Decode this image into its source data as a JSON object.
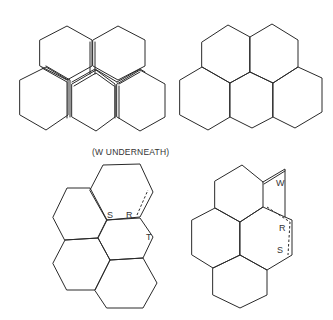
{
  "caption": "(W UNDERNEATH)",
  "colors": {
    "stroke": "#2a2a2a",
    "background": "#ffffff",
    "text": "#333333"
  },
  "figures": {
    "top_left": {
      "description": "five overlapping hexagonal tiles, shown separated with doubled edges",
      "polygons": [
        "40,40 67,26 92,40 92,66 67,80 40,66",
        "93,40 118,26 145,40 145,66 118,80 93,66",
        "20,80 46,67 68,80 68,115 46,130 20,115",
        "72,84 96,70 115,84 115,117 96,131 72,117",
        "117,84 140,70 165,84 165,117 140,131 117,117"
      ],
      "double_lines": [
        "42,68 67,82 67,118",
        "46,66 70,80 70,117",
        "90,42 90,74",
        "95,42 95,74",
        "72,82 95,69 117,82",
        "74,86 96,73 114,86",
        "115,86 115,118",
        "119,86 119,118",
        "117,82 140,69 145,72",
        "119,84 140,72"
      ]
    },
    "top_right": {
      "description": "five hexagonal tiles assembled into a cluster",
      "polygons": [
        "202,42 228,25 250,37 250,72 230,83 202,67",
        "250,37 272,24 298,40 298,67 273,83 250,72",
        "180,80 202,67 230,83 230,117 208,130 180,115",
        "230,83 250,72 273,83 273,117 252,128 230,117",
        "273,83 298,67 322,78 322,112 295,128 273,117"
      ]
    },
    "bottom_left": {
      "description": "five tiles with labels S, R, T and a dashed fold line",
      "polygons": [
        "90,190 103,165 140,164 153,192 140,217 107,220",
        "53,217 67,188 90,188 107,220 98,238 65,240",
        "107,220 140,218 153,237 143,258 110,260 98,238",
        "53,263 65,240 98,238 110,260 95,290 67,290",
        "95,290 110,260 143,258 157,283 143,308 107,308"
      ],
      "dashed": [
        "137,215 148,190"
      ],
      "labels": [
        {
          "text": "S",
          "x": 107,
          "y": 218
        },
        {
          "text": "R",
          "x": 126,
          "y": 218
        },
        {
          "text": "T",
          "x": 146,
          "y": 240
        }
      ]
    },
    "bottom_right": {
      "description": "five tiles with flap W, labels R and S and dashed fold lines",
      "polygons": [
        "215,181 242,165 263,182 263,207 240,222 215,208",
        "240,222 263,207 285,217 292,220 292,255 267,270 240,255",
        "192,220 215,208 240,222 240,255 213,268 192,255",
        "213,268 240,255 267,270 267,295 240,308 213,295"
      ],
      "solid_lines": [
        "263,182 285,169 285,217",
        "264,184 285,171"
      ],
      "dashed": [
        "267,207 290,222 288,255"
      ],
      "labels": [
        {
          "text": "W",
          "x": 276,
          "y": 186
        },
        {
          "text": "R",
          "x": 279,
          "y": 231
        },
        {
          "text": "S",
          "x": 277,
          "y": 253
        }
      ]
    }
  }
}
